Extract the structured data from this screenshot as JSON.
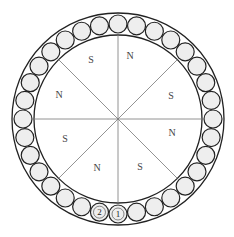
{
  "diagram": {
    "center": [
      118,
      119
    ],
    "outer_radius": 106,
    "inner_radius": 84,
    "ball_ring_radius": 95,
    "ball_radius": 9,
    "ball_count": 32,
    "ball_fill": "#eeeeee",
    "stroke_color": "#222222",
    "spoke_color": "#777777",
    "spoke_angles_deg": [
      0,
      45,
      90,
      135,
      180,
      225,
      270,
      315
    ],
    "numbered_balls": [
      {
        "index": 0,
        "label": "1"
      },
      {
        "index": 1,
        "label": "2"
      }
    ],
    "pole_labels": [
      {
        "text": "S",
        "x": 91,
        "y": 63
      },
      {
        "text": "N",
        "x": 130,
        "y": 59
      },
      {
        "text": "S",
        "x": 171,
        "y": 99
      },
      {
        "text": "N",
        "x": 172,
        "y": 136
      },
      {
        "text": "S",
        "x": 140,
        "y": 170
      },
      {
        "text": "N",
        "x": 97,
        "y": 171
      },
      {
        "text": "S",
        "x": 65,
        "y": 142
      },
      {
        "text": "N",
        "x": 59,
        "y": 98
      }
    ]
  }
}
